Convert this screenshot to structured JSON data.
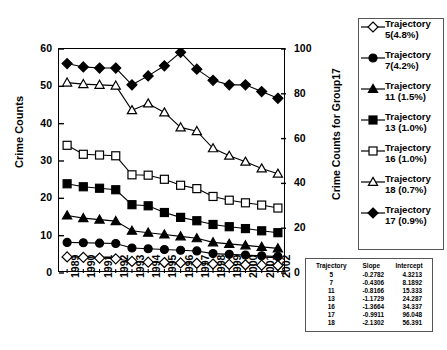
{
  "chart_data": {
    "type": "line",
    "title": "",
    "xlabel": "",
    "ylabel": "Crime Counts",
    "ylabel_right": "Crime Counts for Group17",
    "grid": false,
    "legend_position": "right",
    "x": [
      "1989",
      "1990",
      "1991",
      "1992",
      "1993",
      "1994",
      "1995",
      "1996",
      "1997",
      "1998",
      "1999",
      "2000",
      "2001",
      "2002"
    ],
    "ylim": [
      0,
      60
    ],
    "yticks": [
      0,
      10,
      20,
      30,
      40,
      50,
      60
    ],
    "ylim_right": [
      0,
      100
    ],
    "yticks_right": [
      0,
      20,
      40,
      60,
      80,
      100
    ],
    "series": [
      {
        "name": "Trajectory 5(4.8%)",
        "marker": "open-diamond",
        "axis": "left",
        "values": [
          4.3,
          4.2,
          4.0,
          3.8,
          3.1,
          2.9,
          2.8,
          2.7,
          2.6,
          2.4,
          2.3,
          2.2,
          2.1,
          2.0
        ]
      },
      {
        "name": "Trajectory 7(4.2%)",
        "marker": "filled-circle",
        "axis": "left",
        "values": [
          8.2,
          8.1,
          8.0,
          7.9,
          6.7,
          6.5,
          6.3,
          6.1,
          5.9,
          5.2,
          5.0,
          4.8,
          4.6,
          4.4
        ]
      },
      {
        "name": "Trajectory 11 (1.5%)",
        "marker": "filled-triangle",
        "axis": "left",
        "values": [
          15.4,
          14.7,
          14.3,
          13.9,
          11.3,
          10.8,
          10.3,
          9.8,
          9.3,
          8.2,
          7.8,
          7.4,
          7.0,
          6.6
        ]
      },
      {
        "name": "Trajectory 13 (1.0%)",
        "marker": "filled-square",
        "axis": "left",
        "values": [
          23.9,
          23.1,
          22.7,
          22.3,
          18.3,
          18.0,
          16.2,
          14.9,
          14.0,
          13.0,
          12.4,
          11.9,
          11.3,
          10.8
        ]
      },
      {
        "name": "Trajectory 16 (1.0%)",
        "marker": "open-square",
        "axis": "left",
        "values": [
          34.2,
          31.8,
          31.6,
          31.4,
          26.3,
          26.2,
          25.1,
          23.5,
          22.6,
          20.5,
          19.5,
          18.8,
          18.2,
          17.4
        ]
      },
      {
        "name": "Trajectory 18 (0.7%)",
        "marker": "open-triangle",
        "axis": "left",
        "values": [
          51.0,
          50.6,
          50.4,
          50.2,
          43.6,
          45.4,
          43.0,
          39.0,
          38.0,
          33.4,
          31.4,
          29.8,
          28.0,
          26.6
        ]
      },
      {
        "name": "Trajectory 17 (0.9%)",
        "marker": "filled-diamond",
        "axis": "right",
        "values": [
          93.5,
          92.0,
          91.5,
          91.5,
          84.0,
          88.0,
          92.5,
          98.5,
          91.0,
          86.0,
          84.0,
          84.0,
          81.0,
          78.0
        ]
      }
    ]
  },
  "legend": {
    "items": [
      {
        "label": "Trajectory\n5(4.8%)",
        "marker": "open-diamond"
      },
      {
        "label": "Trajectory\n7(4.2%)",
        "marker": "filled-circle"
      },
      {
        "label": "Trajectory\n11 (1.5%)",
        "marker": "filled-triangle"
      },
      {
        "label": "Trajectory\n13 (1.0%)",
        "marker": "filled-square"
      },
      {
        "label": "Trajectory\n16 (1.0%)",
        "marker": "open-square"
      },
      {
        "label": "Trajectory\n18 (0.7%)",
        "marker": "open-triangle"
      },
      {
        "label": "Trajectory\n17 (0.9%)",
        "marker": "filled-diamond"
      }
    ]
  },
  "stats_table": {
    "headers": [
      "Trajectory",
      "Slope",
      "Intercept"
    ],
    "rows": [
      [
        "5",
        "-0.2782",
        "4.3213"
      ],
      [
        "7",
        "-0.4306",
        "8.1892"
      ],
      [
        "11",
        "-0.8166",
        "15.333"
      ],
      [
        "13",
        "-1.1729",
        "24.287"
      ],
      [
        "16",
        "-1.3664",
        "34.337"
      ],
      [
        "17",
        "-0.9911",
        "96.048"
      ],
      [
        "18",
        "-2.1302",
        "56.391"
      ]
    ]
  },
  "colors": {
    "ink": "#000000",
    "frame": "#555555",
    "background": "#ffffff"
  }
}
